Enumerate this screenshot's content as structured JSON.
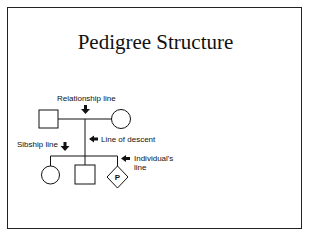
{
  "title": "Pedigree Structure",
  "labels": {
    "relationship_line": "Relationship line",
    "line_of_descent": "Line of descent",
    "sibship_line": "Sibship line",
    "individuals_line_1": "Individual's",
    "individuals_line_2": "line",
    "proband_marker": "P"
  },
  "pedigree": {
    "parents": [
      {
        "sex": "male",
        "symbol": "square"
      },
      {
        "sex": "female",
        "symbol": "circle"
      }
    ],
    "children": [
      {
        "sex": "female",
        "symbol": "circle"
      },
      {
        "sex": "male",
        "symbol": "square"
      },
      {
        "sex": "unknown",
        "symbol": "diamond",
        "marker": "P"
      }
    ]
  }
}
